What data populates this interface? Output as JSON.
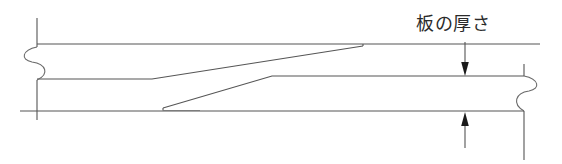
{
  "drawing": {
    "title": "",
    "subject": "scarf-joint-plate-taper",
    "annotations": {
      "thickness_label": "板の厚さ"
    },
    "colors": {
      "background": "#ffffff",
      "line": "#555555",
      "line_dark": "#333333",
      "text": "#2b2b2b",
      "arrow": "#1a1a1a"
    },
    "geometry": {
      "upper_plate": {
        "top_edge_y": 44,
        "left_x": 37,
        "taper_start_x": 152,
        "taper_end_x": 363,
        "tip_y": 45,
        "bottom_left_y": 79
      },
      "lower_plate": {
        "bottom_edge_y": 111,
        "right_x": 524,
        "taper_tip_x": 163,
        "taper_tip_y": 108,
        "taper_join_x": 272,
        "top_right_y": 76
      },
      "break_lines": [
        {
          "name": "left-break",
          "x": 37,
          "top_y": 18,
          "bottom_y": 120,
          "curve_top_y": 47,
          "curve_bottom_y": 80
        },
        {
          "name": "right-break",
          "x": 524,
          "top_y": 64,
          "bottom_y": 160,
          "curve_top_y": 76,
          "curve_bottom_y": 111
        }
      ],
      "dimension_arrows": [
        {
          "name": "upper-thickness-arrow",
          "x": 465,
          "tail_y": 42,
          "tip_y": 75,
          "direction": "down"
        },
        {
          "name": "lower-thickness-arrow",
          "x": 465,
          "tail_y": 148,
          "tip_y": 112,
          "direction": "up"
        }
      ]
    }
  }
}
